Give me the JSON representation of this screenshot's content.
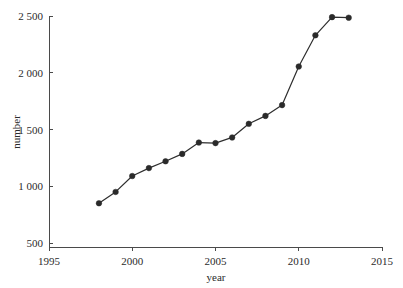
{
  "chart_data": {
    "type": "line",
    "title": "",
    "subtitle": "",
    "xlabel": "year",
    "ylabel": "number",
    "xlim": [
      1995,
      2015
    ],
    "ylim": [
      500,
      2500
    ],
    "grid": false,
    "legend": false,
    "x_ticks": [
      "1995",
      "2000",
      "2005",
      "2010",
      "2015"
    ],
    "x_tick_values": [
      1995,
      2000,
      2005,
      2010,
      2015
    ],
    "y_ticks": [
      "500",
      "1 000",
      "1 500",
      "2 000",
      "2 500"
    ],
    "y_tick_values": [
      500,
      1000,
      1500,
      2000,
      2500
    ],
    "x": [
      1998,
      1999,
      2000,
      2001,
      2002,
      2003,
      2004,
      2005,
      2006,
      2007,
      2008,
      2009,
      2010,
      2011,
      2012,
      2013
    ],
    "series": [
      {
        "name": "number",
        "marker": "filled-circle",
        "color": "#2a2a2a",
        "values": [
          850,
          950,
          1090,
          1160,
          1220,
          1285,
          1385,
          1380,
          1430,
          1550,
          1620,
          1715,
          2055,
          2330,
          2490,
          2485
        ]
      }
    ]
  },
  "axes": {
    "x_axis_label": "year",
    "y_axis_label": "number"
  },
  "colors": {
    "line": "#2e2e2e",
    "marker": "#2a2a2a",
    "axis": "#4a4a4a",
    "text": "#2b2b2b",
    "background": "#ffffff"
  }
}
